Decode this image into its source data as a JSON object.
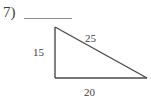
{
  "problem": {
    "number_label": "7)",
    "answer_blank_present": true
  },
  "figure": {
    "type": "right-triangle",
    "labels": {
      "vertical_leg": "15",
      "hypotenuse": "25",
      "base_leg": "20"
    },
    "colors": {
      "stroke": "#4a4a4a",
      "text": "#3d3d3d",
      "blank_line": "#8c8c8c",
      "background": "#ffffff"
    },
    "vertices": {
      "apex": [
        55,
        27
      ],
      "bottom_left": [
        55,
        78
      ],
      "bottom_right": [
        147,
        78
      ]
    }
  }
}
